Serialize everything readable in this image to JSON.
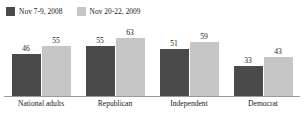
{
  "chart_data": {
    "type": "bar",
    "title": "",
    "xlabel": "",
    "ylabel": "",
    "ylim": [
      0,
      70
    ],
    "grid": false,
    "legend_position": "top-left",
    "categories": [
      "National adults",
      "Republican",
      "Independent",
      "Democrat"
    ],
    "series": [
      {
        "name": "Nov 7-9, 2008",
        "color": "#4a4a4a",
        "values": [
          46,
          55,
          51,
          33
        ]
      },
      {
        "name": "Nov 20-22, 2009",
        "color": "#c6c6c6",
        "values": [
          55,
          63,
          59,
          43
        ]
      }
    ]
  },
  "legend": {
    "entries": [
      {
        "label": "Nov 7-9, 2008",
        "color": "#4a4a4a",
        "swatch_name": "legend-swatch-2008"
      },
      {
        "label": "Nov 20-22, 2009",
        "color": "#c6c6c6",
        "swatch_name": "legend-swatch-2009"
      }
    ]
  },
  "axis": {
    "baseline_color": "#9a9a9a"
  }
}
